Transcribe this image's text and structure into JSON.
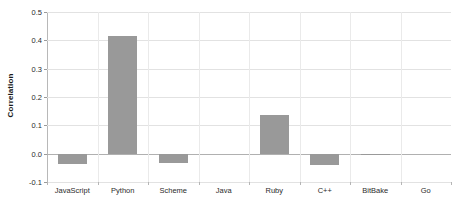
{
  "chart_data": {
    "type": "bar",
    "title": "",
    "subtitle": "",
    "xlabel": "",
    "ylabel": "Correlation",
    "categories": [
      "JavaScript",
      "Python",
      "Scheme",
      "Java",
      "Ruby",
      "C++",
      "BitBake",
      "Go"
    ],
    "values": [
      -0.037,
      0.415,
      -0.034,
      0.0,
      0.135,
      -0.039,
      -0.005,
      0.0
    ],
    "ylim": [
      -0.1,
      0.5
    ],
    "yticks": [
      0.5,
      0.4,
      0.3,
      0.2,
      0.1,
      0.0,
      -0.1
    ],
    "ytick_labels": [
      "0.5",
      "0.4",
      "0.3",
      "0.2",
      "0.1",
      "0.0",
      "-0.1"
    ],
    "grid": true,
    "legend": false,
    "bar_color": "#999999",
    "gridline_color": "#e2e2e2",
    "axis_color": "#b8b8b8",
    "zero_line_color": "#b0b0b0",
    "background_color": "#ffffff"
  }
}
